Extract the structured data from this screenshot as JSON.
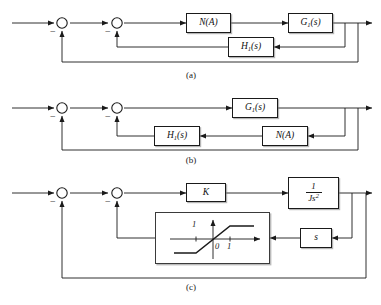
{
  "figure": {
    "kind": "control-system-block-diagrams",
    "panels": [
      {
        "caption": "(a)",
        "blocks": [
          {
            "id": "na_a",
            "label": "N(A)",
            "role": "describing-function"
          },
          {
            "id": "g1_a",
            "label": "G",
            "sub": "1",
            "suffix": "(s)",
            "role": "plant"
          },
          {
            "id": "h1_a",
            "label": "H",
            "sub": "1",
            "suffix": "(s)",
            "role": "inner-feedback"
          }
        ],
        "summing_junctions": [
          {
            "id": "sum_a1",
            "sign": "−"
          },
          {
            "id": "sum_a2",
            "sign": "−"
          }
        ]
      },
      {
        "caption": "(b)",
        "blocks": [
          {
            "id": "g1_b",
            "label": "G",
            "sub": "1",
            "suffix": "(s)",
            "role": "plant"
          },
          {
            "id": "h1_b",
            "label": "H",
            "sub": "1",
            "suffix": "(s)",
            "role": "inner-feedback"
          },
          {
            "id": "na_b",
            "label": "N(A)",
            "role": "describing-function"
          }
        ],
        "summing_junctions": [
          {
            "id": "sum_b1",
            "sign": "−"
          },
          {
            "id": "sum_b2",
            "sign": "−"
          }
        ]
      },
      {
        "caption": "(c)",
        "blocks": [
          {
            "id": "k_c",
            "label": "K",
            "role": "gain"
          },
          {
            "id": "js2_c",
            "numerator": "1",
            "denominator_base": "Js",
            "denominator_exp": "2",
            "role": "plant"
          },
          {
            "id": "s_c",
            "label": "s",
            "role": "rate-feedback"
          }
        ],
        "summing_junctions": [
          {
            "id": "sum_c1",
            "sign": "−"
          },
          {
            "id": "sum_c2",
            "sign": "−"
          }
        ],
        "nonlinearity": {
          "id": "saturation-plot",
          "type": "saturation",
          "origin_label": "0",
          "x_tick_right": "1",
          "x_tick_left": "1"
        }
      }
    ]
  },
  "colors": {
    "line": "#1a1a1a",
    "box_border": "#1a1a1a",
    "sat_border": "#3a3a3a",
    "background": "#ffffff",
    "shadow": "#9a9a9a"
  }
}
